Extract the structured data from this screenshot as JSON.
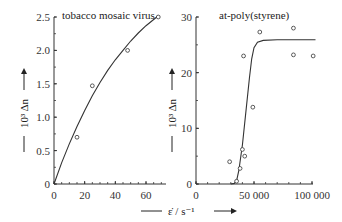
{
  "chart_data": [
    {
      "type": "scatter",
      "title": "tobacco mosaic virus",
      "xlabel": "ε̇ / s⁻¹",
      "ylabel": "10³ Δn",
      "xlim": [
        0,
        70
      ],
      "ylim": [
        0,
        2.5
      ],
      "x_ticks": [
        0,
        20,
        40,
        60
      ],
      "y_ticks": [
        0,
        0.5,
        1.0,
        1.5,
        2.0,
        2.5
      ],
      "y_tick_labels": [
        "0",
        "0.5",
        "1.0",
        "1.5",
        "2.0",
        "2.5"
      ],
      "points": [
        {
          "x": 15,
          "y": 0.7
        },
        {
          "x": 25,
          "y": 1.47
        },
        {
          "x": 48,
          "y": 2.0
        },
        {
          "x": 68,
          "y": 2.5
        }
      ],
      "fit_curve": [
        [
          0,
          0
        ],
        [
          5,
          0.32
        ],
        [
          10,
          0.6
        ],
        [
          15,
          0.86
        ],
        [
          20,
          1.1
        ],
        [
          25,
          1.32
        ],
        [
          30,
          1.52
        ],
        [
          35,
          1.7
        ],
        [
          40,
          1.86
        ],
        [
          45,
          2.0
        ],
        [
          50,
          2.14
        ],
        [
          55,
          2.26
        ],
        [
          60,
          2.37
        ],
        [
          68,
          2.52
        ]
      ]
    },
    {
      "type": "scatter",
      "title": "at-poly(styrene)",
      "xlabel": "ε̇ / s⁻¹",
      "ylabel": "10³ Δn",
      "xlim": [
        0,
        100000
      ],
      "ylim": [
        0,
        30
      ],
      "x_ticks": [
        0,
        50000,
        100000
      ],
      "x_tick_labels": [
        "0",
        "50 000",
        "100 000"
      ],
      "y_ticks": [
        0,
        10,
        20,
        30
      ],
      "points": [
        {
          "x": 29000,
          "y": 4.0
        },
        {
          "x": 35000,
          "y": 0.5
        },
        {
          "x": 38000,
          "y": 2.8
        },
        {
          "x": 40000,
          "y": 6.2
        },
        {
          "x": 42000,
          "y": 5.0
        },
        {
          "x": 41000,
          "y": 23.0
        },
        {
          "x": 49000,
          "y": 13.8
        },
        {
          "x": 55000,
          "y": 27.3
        },
        {
          "x": 84000,
          "y": 28.0
        },
        {
          "x": 84000,
          "y": 23.2
        },
        {
          "x": 101000,
          "y": 23.0
        }
      ],
      "fit_curve": [
        [
          30000,
          0
        ],
        [
          33000,
          0.1
        ],
        [
          35000,
          0.6
        ],
        [
          37000,
          2.5
        ],
        [
          40000,
          7
        ],
        [
          43000,
          13
        ],
        [
          46000,
          19
        ],
        [
          48000,
          22.5
        ],
        [
          50000,
          24.5
        ],
        [
          53000,
          25.5
        ],
        [
          58000,
          25.8
        ],
        [
          70000,
          25.9
        ],
        [
          103000,
          25.9
        ]
      ]
    }
  ],
  "shared_xlabel": "ε̇ / s⁻¹",
  "panels": {
    "left": {
      "title": "tobacco mosaic virus",
      "ylabel": "10³ Δn",
      "y_ticks": [
        "0",
        "0.5",
        "1.0",
        "1.5",
        "2.0",
        "2.5"
      ],
      "x_ticks": [
        "0",
        "20",
        "40",
        "60"
      ]
    },
    "right": {
      "title": "at-poly(styrene)",
      "ylabel": "10³ Δn",
      "y_ticks": [
        "0",
        "10",
        "20",
        "30"
      ],
      "x_ticks": [
        "0",
        "50 000",
        "100 000"
      ]
    }
  }
}
